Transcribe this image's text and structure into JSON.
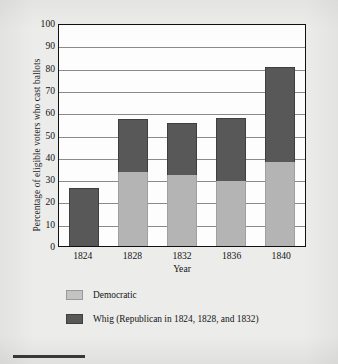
{
  "chart_data": {
    "type": "bar",
    "subtype": "stacked-bar",
    "title": "",
    "xlabel": "Year",
    "ylabel": "Percentage of eligible voters who cast ballots",
    "categories": [
      "1824",
      "1828",
      "1832",
      "1836",
      "1840"
    ],
    "series": [
      {
        "name": "Democratic",
        "color": "#b4b4b4",
        "values": [
          0,
          33,
          32,
          29,
          37.5
        ]
      },
      {
        "name": "Whig (Republican in 1824, 1828, and 1832)",
        "color": "#585858",
        "values": [
          26,
          24,
          23,
          28.5,
          43
        ]
      }
    ],
    "totals": [
      26,
      57,
      55,
      57.5,
      80.5
    ],
    "ylim": [
      0,
      100
    ],
    "yticks": [
      0,
      10,
      20,
      30,
      40,
      50,
      60,
      70,
      80,
      90,
      100
    ],
    "ytick_labels": [
      "0",
      "10",
      "20",
      "30",
      "40",
      "50",
      "60",
      "70",
      "80",
      "90",
      "100"
    ],
    "grid": true,
    "grid_axis": "y",
    "legend_position": "bottom-left"
  },
  "legend": {
    "items": [
      {
        "label": "Democratic",
        "swatch": "light-gray-swatch"
      },
      {
        "label": "Whig (Republican in 1824, 1828, and 1832)",
        "swatch": "dark-gray-swatch"
      }
    ]
  },
  "colors": {
    "page_background": "#ececeb",
    "plot_background": "#fdfdfd",
    "axis": "#111111",
    "gridline": "#8a8a8a",
    "democratic": "#b4b4b4",
    "whig": "#585858",
    "text": "#141414"
  }
}
